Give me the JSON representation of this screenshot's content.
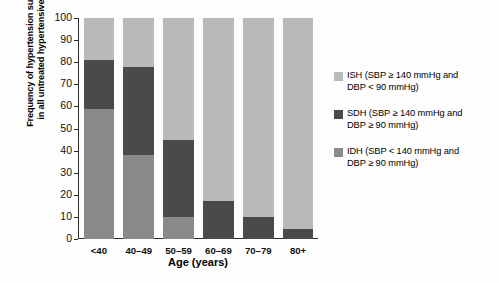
{
  "chart_data": {
    "type": "bar",
    "stacked": true,
    "title": "",
    "xlabel": "Age (years)",
    "ylabel": "Frequency of hypertension subtypes\nin all untreated hypertensives (%)",
    "categories": [
      "<40",
      "40–49",
      "50–59",
      "60–69",
      "70–79",
      "80+"
    ],
    "ylim": [
      0,
      100
    ],
    "yticks": [
      0,
      10,
      20,
      30,
      40,
      50,
      60,
      70,
      80,
      90,
      100
    ],
    "ytick_labels": [
      "0",
      "10",
      "20",
      "30",
      "40",
      "50",
      "60",
      "70",
      "80",
      "90",
      "100"
    ],
    "grid": false,
    "legend_position": "right",
    "series": [
      {
        "name": "IDH (SBP < 140 mmHg and DBP ≥ 90 mmHg)",
        "short": "IDH",
        "color": "#8a8a8a",
        "values": [
          59,
          38,
          10,
          0,
          0,
          0
        ]
      },
      {
        "name": "SDH (SBP ≥ 140 mmHg and DBP ≥ 90 mmHg)",
        "short": "SDH",
        "color": "#4a4a4a",
        "values": [
          22,
          40,
          35,
          17,
          10,
          4.5
        ]
      },
      {
        "name": "ISH (SBP ≥ 140 mmHg and DBP < 90 mmHg)",
        "short": "ISH",
        "color": "#b9b9b9",
        "values": [
          19,
          22,
          55,
          83,
          90,
          95.5
        ]
      }
    ]
  },
  "legend": {
    "entries": [
      {
        "label": "ISH (SBP ≥ 140 mmHg and\nDBP < 90 mmHg)",
        "color": "#b9b9b9",
        "swatch_name": "legend-swatch-ish"
      },
      {
        "label": "SDH (SBP ≥ 140 mmHg and\nDBP ≥ 90 mmHg)",
        "color": "#4a4a4a",
        "swatch_name": "legend-swatch-sdh"
      },
      {
        "label": "IDH (SBP < 140 mmHg and\nDBP ≥ 90 mmHg)",
        "color": "#8a8a8a",
        "swatch_name": "legend-swatch-idh"
      }
    ]
  },
  "caption": ""
}
